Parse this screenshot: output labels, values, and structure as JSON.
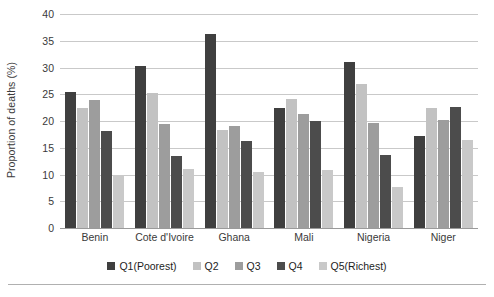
{
  "chart_data": {
    "type": "bar",
    "title": "",
    "xlabel": "",
    "ylabel": "Proportion of deaths (%)",
    "ylim": [
      0,
      40
    ],
    "ytick_step": 5,
    "yticks": [
      40,
      35,
      30,
      25,
      20,
      15,
      10,
      5,
      0
    ],
    "grid": true,
    "legend_position": "bottom",
    "categories": [
      "Benin",
      "Cote d'Ivoire",
      "Ghana",
      "Mali",
      "Nigeria",
      "Niger"
    ],
    "series": [
      {
        "name": "Q1(Poorest)",
        "color": "#3f3f3f",
        "values": [
          25.5,
          30.2,
          36.3,
          22.5,
          31.0,
          17.2
        ]
      },
      {
        "name": "Q2",
        "color": "#c2c2c2",
        "values": [
          22.4,
          25.3,
          18.4,
          24.2,
          27.0,
          22.5
        ]
      },
      {
        "name": "Q3",
        "color": "#9d9d9d",
        "values": [
          23.9,
          19.4,
          19.0,
          21.4,
          19.6,
          20.2
        ]
      },
      {
        "name": "Q4",
        "color": "#4c4c4c",
        "values": [
          18.1,
          13.5,
          16.2,
          20.0,
          13.6,
          22.6
        ]
      },
      {
        "name": "Q5(Richest)",
        "color": "#c9c9c9",
        "values": [
          9.9,
          11.0,
          10.5,
          10.8,
          7.7,
          16.4
        ]
      }
    ]
  }
}
